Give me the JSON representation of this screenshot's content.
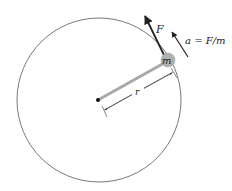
{
  "diagram": {
    "type": "circular-motion",
    "labels": {
      "force": "F",
      "acceleration": "a = F/m",
      "mass": "m",
      "radius": "r"
    },
    "colors": {
      "circle": "#555555",
      "rod": "#a8a8a8",
      "mass_fill": "#b0b0b0",
      "arrow": "#222222",
      "dimension": "#333333"
    }
  }
}
